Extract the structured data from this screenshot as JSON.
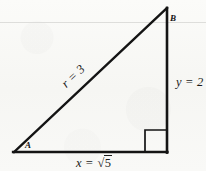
{
  "figure": {
    "type": "right-triangle-diagram",
    "background_color": "#f8f8f6",
    "ink_color": "#141414",
    "scan_rule_color": "#d8d8d6",
    "vertices": {
      "A": {
        "label": "A",
        "x": 14,
        "y": 152
      },
      "B": {
        "label": "B",
        "x": 167,
        "y": 8
      },
      "C": {
        "label": "",
        "x": 167,
        "y": 152
      }
    },
    "sides": [
      {
        "name": "hypotenuse",
        "label_variable": "r",
        "label_value": "3",
        "label_text": "r = 3",
        "from": "A",
        "to": "B",
        "rotation_deg": -43.3
      },
      {
        "name": "vertical-leg",
        "label_variable": "y",
        "label_value": "2",
        "label_text": "y = 2",
        "from": "B",
        "to": "C",
        "rotation_deg": 0
      },
      {
        "name": "horizontal-leg",
        "label_variable": "x",
        "label_value": "√5",
        "label_prefix": "x = ",
        "radical_symbol": "√",
        "radicand": "5",
        "from": "A",
        "to": "C",
        "rotation_deg": 0
      }
    ],
    "right_angle": {
      "at_vertex": "C",
      "marker": "square",
      "size": 22
    }
  }
}
